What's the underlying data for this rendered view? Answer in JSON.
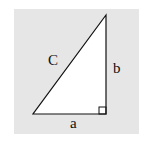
{
  "diagram": {
    "labels": {
      "hypotenuse": "C",
      "vertical_leg": "b",
      "horizontal_leg": "a"
    },
    "colors": {
      "background": "#e6e6e6",
      "triangle_fill": "#ffffff",
      "stroke": "#111111"
    },
    "right_angle_marker": true
  }
}
